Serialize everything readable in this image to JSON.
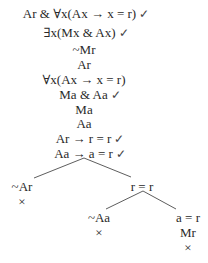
{
  "tree": {
    "trunk": [
      {
        "text": "Ar & ∀x(Ax → x = r)",
        "check": "✓",
        "x": 86,
        "y": 6
      },
      {
        "text": "∃x(Mx & Ax)",
        "check": "✓",
        "x": 86,
        "y": 25
      },
      {
        "text": "~Mr",
        "check": "",
        "x": 84,
        "y": 42
      },
      {
        "text": "Ar",
        "check": "",
        "x": 84,
        "y": 57
      },
      {
        "text": "∀x(Ax → x = r)",
        "check": "",
        "x": 84,
        "y": 72
      },
      {
        "text": "Ma & Aa",
        "check": "✓",
        "x": 90,
        "y": 87
      },
      {
        "text": "Ma",
        "check": "",
        "x": 84,
        "y": 102
      },
      {
        "text": "Aa",
        "check": "",
        "x": 84,
        "y": 116
      },
      {
        "text": "Ar → r = r",
        "check": "✓",
        "x": 90,
        "y": 131
      },
      {
        "text": "Aa → a = r",
        "check": "✓",
        "x": 90,
        "y": 146
      }
    ],
    "left_branch": [
      {
        "text": "~Ar",
        "x": 22,
        "y": 179
      },
      {
        "text": "×",
        "x": 22,
        "y": 194
      }
    ],
    "right_branch": [
      {
        "text": "r = r",
        "x": 142,
        "y": 179
      }
    ],
    "right_left_branch": [
      {
        "text": "~Aa",
        "x": 99,
        "y": 210
      },
      {
        "text": "×",
        "x": 99,
        "y": 225
      }
    ],
    "right_right_branch": [
      {
        "text": "a = r",
        "x": 188,
        "y": 210
      },
      {
        "text": "Mr",
        "x": 188,
        "y": 225
      },
      {
        "text": "×",
        "x": 188,
        "y": 240
      }
    ]
  }
}
